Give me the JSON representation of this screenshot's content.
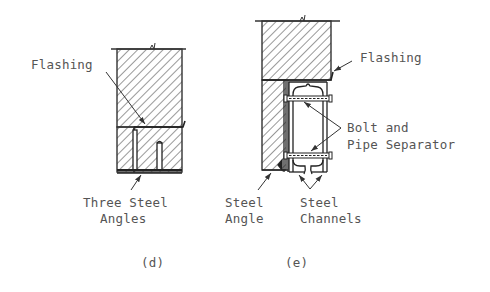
{
  "figure_d": {
    "caption": "(d)",
    "labels": {
      "flashing": "Flashing",
      "angles_line1": "Three Steel",
      "angles_line2": "Angles"
    }
  },
  "figure_e": {
    "caption": "(e)",
    "labels": {
      "flashing": "Flashing",
      "bolt_line1": "Bolt and",
      "bolt_line2": "Pipe Separator",
      "angle_line1": "Steel",
      "angle_line2": "Angle",
      "channels_line1": "Steel",
      "channels_line2": "Channels"
    }
  },
  "colors": {
    "ink": "#333333",
    "text": "#555555",
    "background": "#ffffff"
  }
}
